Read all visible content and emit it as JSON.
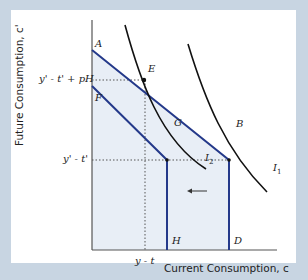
{
  "figure": {
    "y_axis_label": "Future Consumption, c'",
    "x_axis_label": "Current Consumption, c",
    "y_ticks": [
      {
        "label": "y' - t' + pH",
        "y": 80
      },
      {
        "label": "y' - t'",
        "y": 160
      }
    ],
    "x_ticks": [
      {
        "label": "y - t",
        "x": 145
      }
    ],
    "points": {
      "A": "A",
      "E": "E",
      "F": "F",
      "G": "G",
      "B": "B",
      "H": "H",
      "D": "D"
    },
    "curves": {
      "I1": "I",
      "I1_sub": "1",
      "I2": "I",
      "I2_sub": "2"
    },
    "colors": {
      "background": "#c8d5e2",
      "panel": "#ffffff",
      "shade": "#e8eef6",
      "budget_line": "#24398a",
      "indifference": "#111111",
      "dotted": "#555555"
    }
  }
}
